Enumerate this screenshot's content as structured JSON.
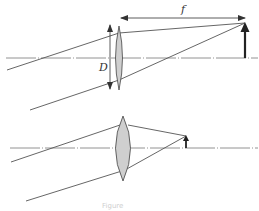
{
  "figure": {
    "type": "optics-ray-diagram",
    "colors": {
      "background": "#ffffff",
      "line": "#555555",
      "axis": "#777777",
      "lens_fill": "#cfcfcf",
      "arrow": "#222222",
      "caption": "#d0d0d0"
    },
    "top_panel": {
      "description": "Thin lens with long focal length",
      "focal_length_label": "f",
      "aperture_label": "D",
      "optical_axis_y": 58,
      "lens": {
        "cx": 119,
        "top": 26,
        "bottom": 90,
        "half_width": 4
      },
      "image_arrow": {
        "x": 245,
        "base_y": 58,
        "tip_y": 23,
        "size": "large"
      },
      "focal_dimension": {
        "x1": 120,
        "x2": 246,
        "y": 18
      },
      "aperture_dimension": {
        "x": 110,
        "y1": 24,
        "y2": 90
      }
    },
    "bottom_panel": {
      "description": "Thick lens with short focal length",
      "optical_axis_y": 148,
      "lens": {
        "cx": 123,
        "top": 116,
        "bottom": 181,
        "half_width": 9
      },
      "image_arrow": {
        "x": 186,
        "base_y": 148,
        "tip_y": 136,
        "size": "small"
      }
    },
    "caption": "Figure"
  }
}
